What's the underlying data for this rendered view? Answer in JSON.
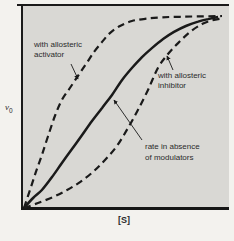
{
  "figure": {
    "y_label": {
      "base": "v",
      "sub": "0"
    },
    "x_label": "[S]",
    "annotations": {
      "activator": {
        "line1": "with allosteric",
        "line2": "activator"
      },
      "inhibitor": {
        "line1": "with allosteric",
        "line2": "inhibitor"
      },
      "no_modulators": {
        "line1": "rate in absence",
        "line2": "of modulators"
      }
    }
  },
  "colors": {
    "page_bg": "#f3f2ee",
    "plot_bg": "#d9d8d4",
    "ink": "#1a1a1a",
    "text": "#2b2b2b"
  },
  "chart_data": {
    "type": "line",
    "title": "",
    "xlabel": "[S]",
    "ylabel": "v0",
    "grid": false,
    "axis_ticks": "none (qualitative sketch, normalized 0-1 coordinates)",
    "xlim": [
      0,
      1
    ],
    "ylim": [
      0,
      1
    ],
    "legend_position": "inline-arrow-annotations",
    "series": [
      {
        "name": "with allosteric activator",
        "line_style": "dashed",
        "x": [
          0,
          0.029,
          0.058,
          0.087,
          0.117,
          0.15,
          0.184,
          0.223,
          0.262,
          0.301,
          0.34,
          0.379,
          0.417,
          0.466,
          0.524,
          0.592,
          0.67,
          0.757,
          0.854,
          0.961
        ],
        "y": [
          0,
          0.094,
          0.188,
          0.276,
          0.375,
          0.479,
          0.563,
          0.625,
          0.688,
          0.75,
          0.813,
          0.865,
          0.911,
          0.948,
          0.974,
          0.986,
          0.993,
          0.996,
          0.998,
          1.0
        ]
      },
      {
        "name": "rate in absence of modulators",
        "line_style": "solid",
        "x": [
          0,
          0.044,
          0.087,
          0.136,
          0.184,
          0.233,
          0.282,
          0.33,
          0.379,
          0.427,
          0.476,
          0.524,
          0.573,
          0.621,
          0.675,
          0.728,
          0.786,
          0.845,
          0.893,
          0.942
        ],
        "y": [
          0,
          0.052,
          0.094,
          0.161,
          0.234,
          0.307,
          0.38,
          0.453,
          0.521,
          0.589,
          0.667,
          0.729,
          0.786,
          0.833,
          0.88,
          0.917,
          0.948,
          0.971,
          0.984,
          0.995
        ]
      },
      {
        "name": "with allosteric inhibitor",
        "line_style": "dashed",
        "x": [
          0,
          0.068,
          0.141,
          0.209,
          0.272,
          0.335,
          0.393,
          0.451,
          0.505,
          0.553,
          0.602,
          0.65,
          0.699,
          0.748,
          0.806,
          0.864,
          0.913,
          0.961
        ],
        "y": [
          0,
          0.026,
          0.057,
          0.094,
          0.135,
          0.188,
          0.25,
          0.323,
          0.417,
          0.51,
          0.615,
          0.729,
          0.802,
          0.859,
          0.917,
          0.958,
          0.977,
          0.987
        ]
      }
    ],
    "annotation_arrows": [
      {
        "target": "activator",
        "from_px": [
          71,
          64
        ],
        "to_px": [
          78,
          79
        ]
      },
      {
        "target": "inhibitor",
        "from_px": [
          173,
          70
        ],
        "to_px": [
          167,
          56
        ]
      },
      {
        "target": "no_modulators",
        "from_px": [
          142,
          140
        ],
        "to_px": [
          114,
          100
        ]
      }
    ]
  }
}
